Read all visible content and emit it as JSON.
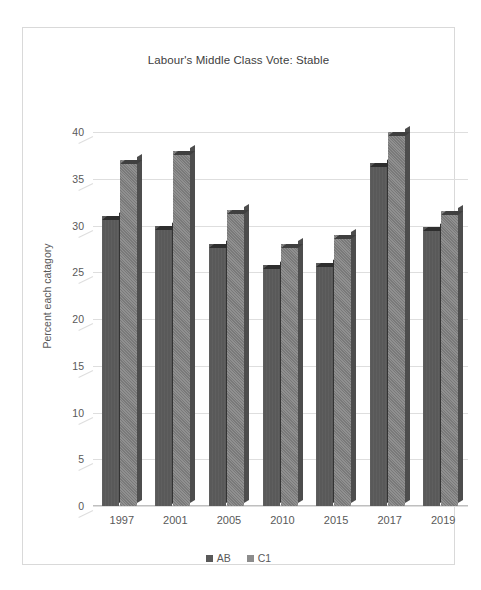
{
  "chart_data": {
    "type": "bar",
    "title": "Labour's Middle Class Vote: Stable",
    "xlabel": "",
    "ylabel": "Percent each catagory",
    "categories": [
      "1997",
      "2001",
      "2005",
      "2010",
      "2015",
      "2017",
      "2019"
    ],
    "series": [
      {
        "name": "AB",
        "values": [
          31,
          30,
          28,
          25.8,
          26,
          36.7,
          29.8
        ],
        "color": "#595959"
      },
      {
        "name": "C1",
        "values": [
          37,
          38,
          31.7,
          28,
          29,
          40,
          31.5
        ],
        "color": "#808080"
      }
    ],
    "ylim": [
      0,
      40
    ],
    "yticks": [
      0,
      5,
      10,
      15,
      20,
      25,
      30,
      35,
      40
    ],
    "grid": true,
    "legend_position": "bottom",
    "style": "3d-clustered-column"
  },
  "legend": {
    "items": [
      {
        "label": "AB"
      },
      {
        "label": "C1"
      }
    ]
  }
}
